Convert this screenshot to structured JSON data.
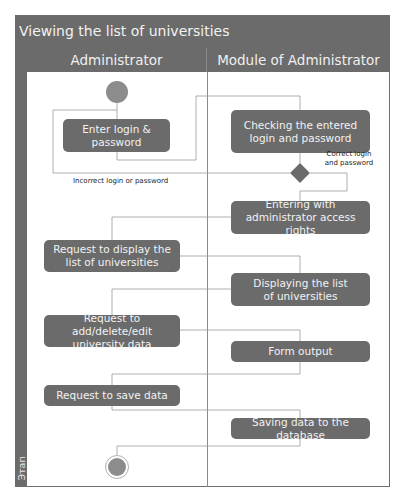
{
  "diagram": {
    "title": "Viewing the list of universities",
    "lanes": [
      {
        "name": "Administrator"
      },
      {
        "name": "Module of Administrator"
      }
    ],
    "stage_label": "Этап",
    "start_node": "initial-node",
    "end_node": "final-node",
    "activities": [
      {
        "id": "enter_login",
        "label": "Enter login & password",
        "lane": "Administrator"
      },
      {
        "id": "check_login",
        "label": "Checking the entered login and password",
        "lane": "Module of Administrator"
      },
      {
        "id": "enter_admin",
        "label": "Entering with administrator access rights",
        "lane": "Module of Administrator"
      },
      {
        "id": "req_display",
        "label": "Request to display the list of universities",
        "lane": "Administrator"
      },
      {
        "id": "display_list",
        "label": "Displaying the list of universities",
        "lane": "Module of Administrator"
      },
      {
        "id": "req_edit",
        "label": "Request to add/delete/edit university data",
        "lane": "Administrator"
      },
      {
        "id": "form_output",
        "label": "Form output",
        "lane": "Module of Administrator"
      },
      {
        "id": "req_save",
        "label": "Request to save data",
        "lane": "Administrator"
      },
      {
        "id": "save_db",
        "label": "Saving data to the database",
        "lane": "Module of Administrator"
      }
    ],
    "guards": {
      "correct": "Correct login and password",
      "incorrect": "Incorrect login or password"
    },
    "colors": {
      "node_fill": "#6b6b6b",
      "node_text": "#f2f2f2",
      "header_fill": "#6b6b6b",
      "start_fill": "#8c8c8c",
      "line": "#9a9a9a"
    }
  }
}
